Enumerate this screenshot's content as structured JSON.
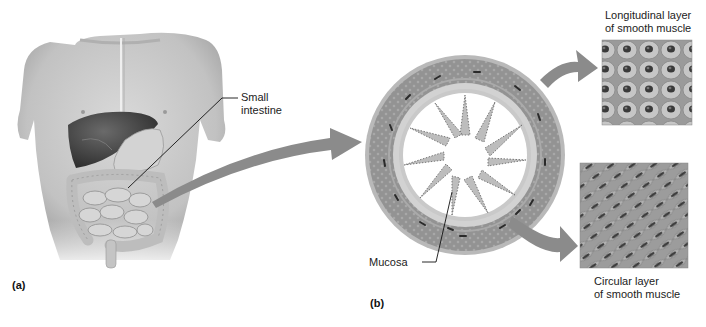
{
  "figure": {
    "panels": [
      {
        "id": "a",
        "label": "(a)",
        "subject": "torso with abdominal organs"
      },
      {
        "id": "b",
        "label": "(b)",
        "subject": "cross section of small intestine wall"
      }
    ],
    "labels": {
      "small_intestine": [
        "Small",
        "intestine"
      ],
      "mucosa": "Mucosa",
      "longitudinal": [
        "Longitudinal layer",
        "of smooth muscle"
      ],
      "circular": [
        "Circular layer",
        "of smooth muscle"
      ]
    },
    "colors": {
      "background": "#ffffff",
      "skin": "#cfcfcf",
      "skin_shadow": "#a9a9a9",
      "liver": "#4a4a4a",
      "intestine": "#c4c4c4",
      "muscle_ring": "#8f8f8f",
      "arrow": "#8a8a8a",
      "text": "#222222"
    }
  }
}
